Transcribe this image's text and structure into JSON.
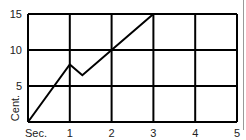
{
  "chart_data": {
    "type": "line",
    "title": "",
    "xlabel": "Sec.",
    "ylabel": "Cent.",
    "x_ticks": [
      "Sec.",
      "1",
      "2",
      "3",
      "4",
      "5"
    ],
    "y_ticks": [
      "5",
      "10",
      "15"
    ],
    "xlim": [
      0,
      5
    ],
    "ylim": [
      0,
      15
    ],
    "grid": true,
    "legend": null,
    "series": [
      {
        "name": "displacement",
        "x": [
          0,
          1,
          1.3,
          2,
          3
        ],
        "y": [
          0,
          8,
          6.5,
          10,
          15
        ]
      }
    ]
  }
}
